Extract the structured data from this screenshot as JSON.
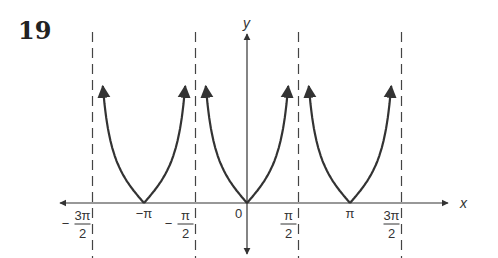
{
  "problem_number": "19",
  "chart_data": {
    "type": "line",
    "function": "y = |tan x|",
    "title": "",
    "xlabel": "x",
    "ylabel": "y",
    "xlim": [
      -2.0,
      2.0
    ],
    "x_unit": "pi",
    "grid": false,
    "asymptotes": [
      -1.5,
      -0.5,
      0.5,
      1.5
    ],
    "vertices": [
      -1,
      0,
      1
    ],
    "origin_label": "0",
    "tick_labels": [
      {
        "x": -1.5,
        "num": "3π",
        "den": "2",
        "sign": "−"
      },
      {
        "x": -1,
        "text": "−π"
      },
      {
        "x": -0.5,
        "num": "π",
        "den": "2",
        "sign": "−"
      },
      {
        "x": 0.5,
        "num": "π",
        "den": "2",
        "sign": ""
      },
      {
        "x": 1,
        "text": "π"
      },
      {
        "x": 1.5,
        "num": "3π",
        "den": "2",
        "sign": ""
      }
    ],
    "branches": [
      {
        "from": -1.5,
        "to": -0.5
      },
      {
        "from": -0.5,
        "to": 0.5
      },
      {
        "from": 0.5,
        "to": 1.5
      }
    ],
    "colors": {
      "curve": "#333333",
      "axis": "#333333",
      "asymptote": "#444444"
    }
  }
}
